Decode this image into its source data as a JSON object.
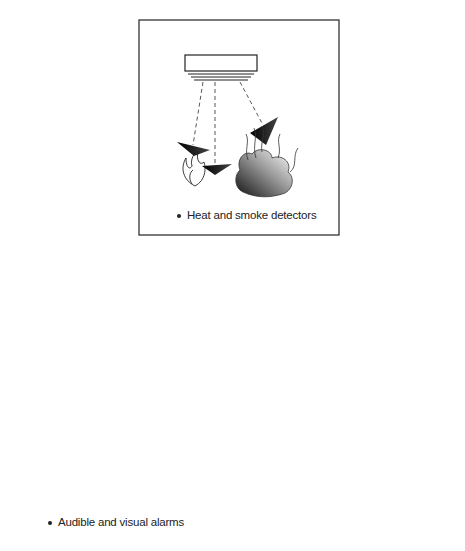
{
  "diagram": {
    "top_box": {
      "caption": "Heat and smoke detectors",
      "icons": [
        "smoke-detector",
        "heat-wave",
        "flame",
        "smoke-cloud"
      ]
    },
    "bottom_left_box": {
      "caption": "Audible and visual alarms",
      "icons": [
        "alarm-bell",
        "sound-waves",
        "ear",
        "strobe-light",
        "eye"
      ]
    },
    "bottom_right_box": {
      "caption": "",
      "icons": [
        "sprinkler-pipe",
        "sprinkler-head",
        "water-spray",
        "flame"
      ]
    },
    "connections": [
      {
        "from": "top_box",
        "to": "bottom_left_box"
      },
      {
        "from": "top_box",
        "to": "bottom_right_box"
      }
    ],
    "colors": {
      "line": "#333333",
      "fill_dark": "#111111"
    }
  }
}
